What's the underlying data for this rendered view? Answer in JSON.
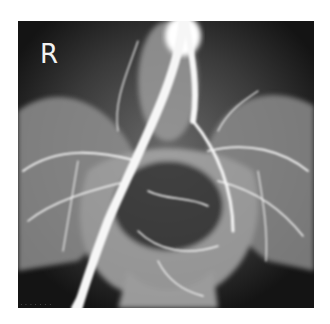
{
  "image": {
    "type": "pelvic angiogram radiograph",
    "side_marker": "R",
    "caption": "· · ·  · · · ·",
    "colors": {
      "background": "#ffffff",
      "film_dark": "#1a1a1a",
      "bone": "#bdbdbd",
      "vessel": "#f4f4f4"
    }
  }
}
